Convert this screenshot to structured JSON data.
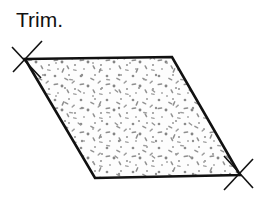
{
  "canvas": {
    "width": 269,
    "height": 205,
    "background_color": "#ffffff"
  },
  "label": {
    "text": "Trim.",
    "color": "#111111",
    "x": 16,
    "y": 8,
    "font_size": 21
  },
  "figure": {
    "name": "parallelogram",
    "outline_color": "#111111",
    "outline_width": 2.6,
    "fill_color": "#fdfdfd",
    "vertices": [
      {
        "name": "top-left",
        "x": 25,
        "y": 59
      },
      {
        "name": "top-right",
        "x": 172,
        "y": 57
      },
      {
        "name": "bottom-right",
        "x": 240,
        "y": 175
      },
      {
        "name": "bottom-left",
        "x": 95,
        "y": 178
      }
    ],
    "points_attr": "25,59 172,57 240,175 95,178"
  },
  "texture": {
    "name": "speckle-fill",
    "dot_color": "#8c8c8c",
    "dash_color": "#9a9a9a",
    "description": "scattered small gray dots and short dashes"
  },
  "tick_marks": {
    "color": "#111111",
    "width": 1.6,
    "marks": [
      {
        "name": "top-left-tick-upper",
        "x1": 13,
        "y1": 72,
        "x2": 42,
        "y2": 41
      },
      {
        "name": "top-left-tick-lower",
        "x1": 12,
        "y1": 47,
        "x2": 41,
        "y2": 78
      },
      {
        "name": "bottom-right-tick-upper",
        "x1": 224,
        "y1": 190,
        "x2": 253,
        "y2": 159
      },
      {
        "name": "bottom-right-tick-lower",
        "x1": 224,
        "y1": 156,
        "x2": 253,
        "y2": 188
      }
    ]
  }
}
